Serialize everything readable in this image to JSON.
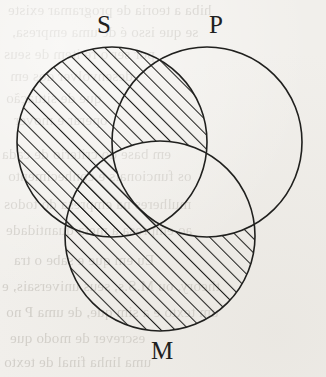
{
  "page": {
    "kind": "scanned-book-figure",
    "width": 326,
    "height": 377,
    "background_color": "#f1efeb",
    "ink_color": "#20201e",
    "bleed_color": "#b9b5ae"
  },
  "figure": {
    "type": "venn-diagram",
    "circle_count": 3,
    "radius": 95,
    "circles": [
      {
        "id": "S",
        "label": "S",
        "cx": 112,
        "cy": 142,
        "r": 95,
        "label_x": 104,
        "label_y": 12
      },
      {
        "id": "P",
        "label": "P",
        "cx": 207,
        "cy": 142,
        "r": 95,
        "label_x": 216,
        "label_y": 12
      },
      {
        "id": "M",
        "label": "M",
        "cx": 160,
        "cy": 236,
        "r": 95,
        "label_x": 162,
        "label_y": 338
      }
    ],
    "shading": {
      "style": "diagonal-hatch",
      "direction": "rising",
      "angle_deg": 45,
      "spacing_px": 10,
      "line_width_px": 2.1,
      "color": "#20201e",
      "shaded_regions": [
        "S-only",
        "S-and-P-not-M",
        "S-and-M-not-P",
        "M-only",
        "M-and-P-not-S-excluded"
      ],
      "unshaded_regions": [
        "P-only",
        "P-and-M-not-S",
        "S-and-P-and-M",
        "outside-all"
      ],
      "description": "All of S is hatched except the central triple-overlap; all of M is hatched except the part inside P."
    }
  },
  "labels": {
    "subject": "S",
    "predicate": "P",
    "middle": "M"
  },
  "bleed_text": {
    "note": "faint mirrored show-through from the reverse page",
    "lines": [
      {
        "text": "hiba a teoria de programar existe",
        "x": 8,
        "y": 2,
        "size": 15
      },
      {
        "text": "se que isso é de uma empresa,",
        "x": 12,
        "y": 24,
        "size": 15
      },
      {
        "text": "por ser o re item de seus",
        "x": 4,
        "y": 46,
        "size": 15
      },
      {
        "text": "desenvolver dos em",
        "x": 10,
        "y": 68,
        "size": 15
      },
      {
        "text": "que de situação",
        "x": 6,
        "y": 90,
        "size": 15
      },
      {
        "text": "operar e mover",
        "x": 14,
        "y": 112,
        "size": 15
      },
      {
        "text": "em base do criterio de cada",
        "x": 2,
        "y": 146,
        "size": 15
      },
      {
        "text": "os funcionais e conhecimento",
        "x": 8,
        "y": 168,
        "size": 15
      },
      {
        "text": "mulheres na empresa do todos",
        "x": 4,
        "y": 196,
        "size": 15
      },
      {
        "text": "ao empresa a meta quantidade",
        "x": 6,
        "y": 222,
        "size": 15
      },
      {
        "text": "Eu em que e sabe o tra",
        "x": 14,
        "y": 252,
        "size": 15
      },
      {
        "text": "theory, ou M.S.s, seus universais, e",
        "x": 2,
        "y": 278,
        "size": 15
      },
      {
        "text": "um texto e a sim que, de uma P no",
        "x": 6,
        "y": 304,
        "size": 15
      },
      {
        "text": "escrever de modo que",
        "x": 10,
        "y": 330,
        "size": 15
      },
      {
        "text": "uma linha final de texto",
        "x": 4,
        "y": 354,
        "size": 15
      }
    ]
  }
}
